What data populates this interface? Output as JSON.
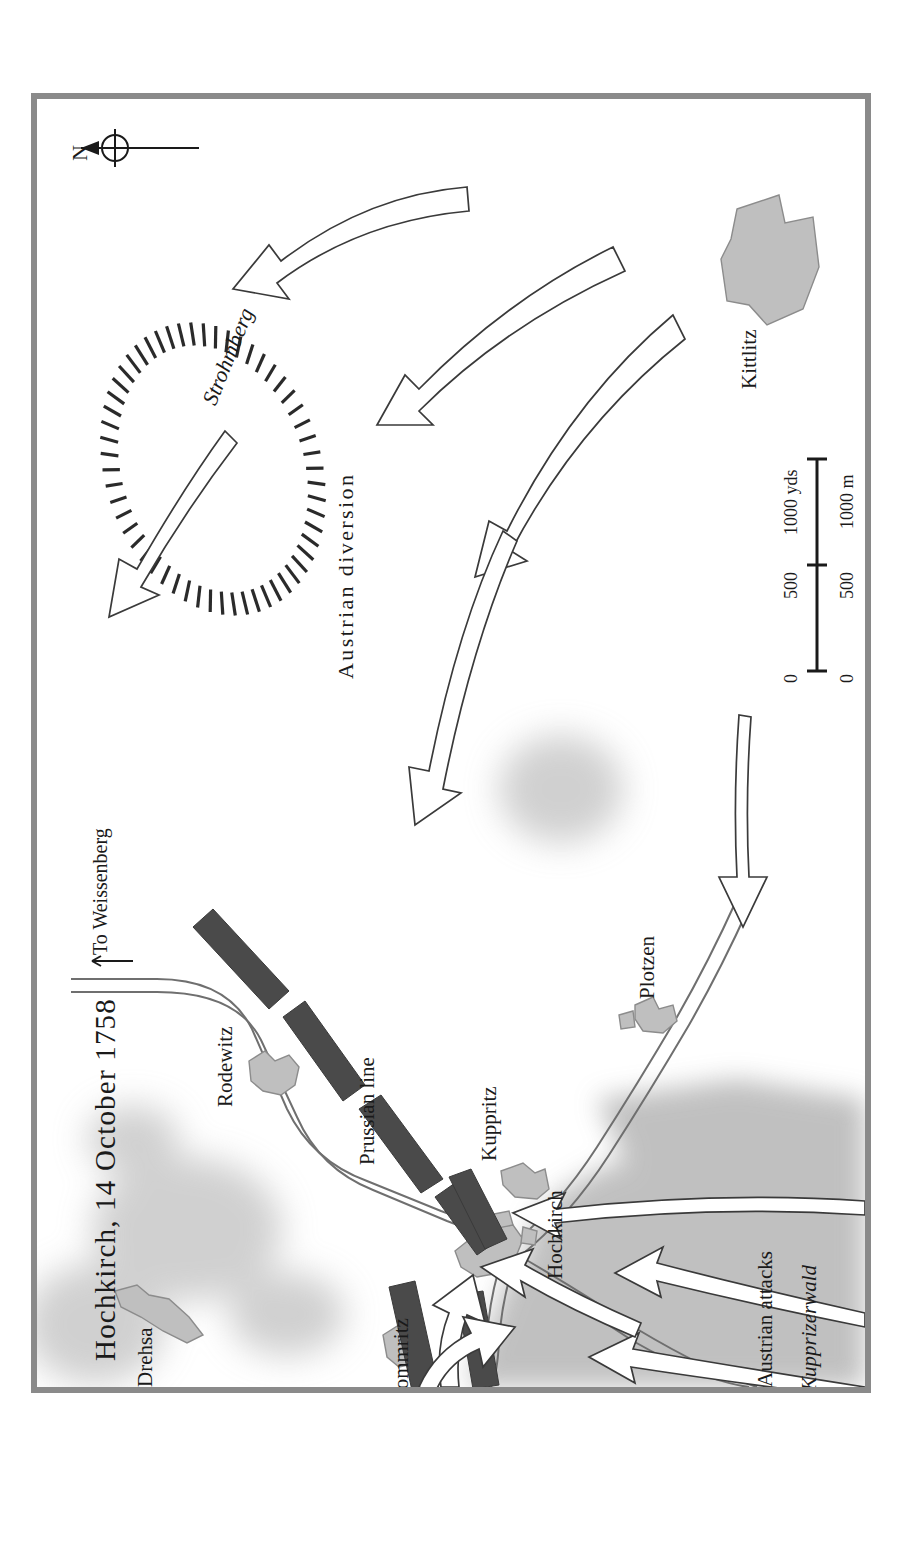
{
  "figure": {
    "kind": "historical-battle-map",
    "orientation_note": "all map text is rotated 90 degrees counter-clockwise",
    "title": "Hochkirch, 14 October 1758",
    "frame_color": "#8a8a8a",
    "background_color": "#ffffff"
  },
  "compass": {
    "label": "N",
    "icon": "north-arrow-icon"
  },
  "scalebar": {
    "icon": "scale-bar-icon",
    "top_unit": "yds",
    "bottom_unit": "m",
    "top_ticks": [
      "0",
      "500",
      "1000 yds"
    ],
    "bottom_ticks": [
      "0",
      "500",
      "1000 m"
    ]
  },
  "settlements": [
    {
      "name": "Drehsa",
      "color": "#bfbfbf"
    },
    {
      "name": "Rodewitz",
      "color": "#bfbfbf"
    },
    {
      "name": "Pommritz",
      "color": "#bfbfbf"
    },
    {
      "name": "Kuppritz",
      "color": "#bfbfbf"
    },
    {
      "name": "Hochkirch",
      "color": "#bfbfbf"
    },
    {
      "name": "Plotzen",
      "color": "#bfbfbf"
    },
    {
      "name": "Kittlitz",
      "color": "#bfbfbf"
    }
  ],
  "terrain": [
    {
      "name": "Strohmberg",
      "style": "italic",
      "feature": "hill-hachure"
    },
    {
      "name": "Kupprizerwald",
      "style": "italic",
      "feature": "woodland"
    }
  ],
  "forces": {
    "prussian": {
      "label": "Prussian line",
      "block_color": "#4a4a4a"
    },
    "austrian": {
      "diversion_label": "Austrian diversion",
      "attacks_label": "Austrian attacks",
      "arrow_fill": "#ffffff",
      "arrow_stroke": "#3a3a3a"
    }
  },
  "roads": [
    {
      "label": "To Weissenberg",
      "icon": "road-direction-arrow-icon"
    }
  ],
  "colors": {
    "village_fill": "#bfbfbf",
    "woodland_fill": "#bcbcbc",
    "hill_shade": "#c9c9c9",
    "battalion_fill": "#4a4a4a",
    "road_casing": "#6f6f6f",
    "ink": "#1a1a1a"
  }
}
